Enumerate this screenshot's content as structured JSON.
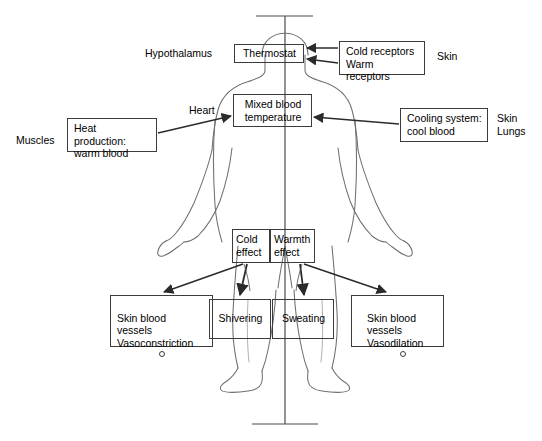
{
  "diagram": {
    "background_color": "#ffffff",
    "line_color": "#3c3c3c",
    "text_color": "#000000",
    "body_outline_color": "#6f6f6f"
  },
  "boxes": {
    "thermostat": {
      "label": "Thermostat",
      "x": 234,
      "y": 44,
      "w": 70,
      "h": 19
    },
    "mixed_blood": {
      "label": "Mixed blood\ntemperature",
      "x": 233,
      "y": 94,
      "w": 79,
      "h": 33
    },
    "heat_production": {
      "label": "Heat production:\nwarm blood",
      "x": 67,
      "y": 118,
      "w": 90,
      "h": 34
    },
    "receptors": {
      "label": "Cold receptors\nWarm receptors",
      "x": 339,
      "y": 41,
      "w": 86,
      "h": 34
    },
    "cooling_system": {
      "label": "Cooling system:\ncool blood",
      "x": 400,
      "y": 108,
      "w": 88,
      "h": 34
    },
    "cold_effect": {
      "label": "Cold\neffect",
      "x": 232,
      "y": 229,
      "w": 38,
      "h": 34
    },
    "warmth_effect": {
      "label": "Warmth\neffect",
      "x": 270,
      "y": 229,
      "w": 45,
      "h": 34
    },
    "vasoconstriction": {
      "label": "Skin blood\nvessels\nVasoconstriction",
      "x": 110,
      "y": 295,
      "w": 103,
      "h": 52
    },
    "shivering": {
      "label": "Shivering",
      "x": 209,
      "y": 299,
      "w": 62,
      "h": 40
    },
    "sweating": {
      "label": "Sweating",
      "x": 272,
      "y": 299,
      "w": 62,
      "h": 40
    },
    "vasodilation": {
      "label": "Skin blood\nvessels\nVasodilation",
      "x": 351,
      "y": 295,
      "w": 93,
      "h": 52
    }
  },
  "labels": {
    "hypothalamus": {
      "text": "Hypothalamus",
      "x": 145,
      "y": 47
    },
    "skin_receptors": {
      "text": "Skin",
      "x": 437,
      "y": 50
    },
    "heart": {
      "text": "Heart",
      "x": 189,
      "y": 104
    },
    "muscles": {
      "text": "Muscles",
      "x": 16,
      "y": 134
    },
    "skin_lungs": {
      "text": "Skin\nLungs",
      "x": 497,
      "y": 112
    }
  },
  "markers": {
    "vasoconstriction_circle": "circle-outline",
    "vasodilation_circle": "circle-outline"
  }
}
